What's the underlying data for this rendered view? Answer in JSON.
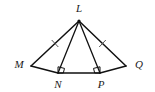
{
  "figure": {
    "background_color": "#ffffff",
    "stroke_color": "#111111",
    "label_color": "#1a1a1a",
    "tick_color": "#555555",
    "labels": {
      "apex": "L",
      "left": "M",
      "base_left": "N",
      "base_right": "P",
      "right": "Q"
    },
    "points": {
      "L": {
        "x": 79,
        "y": 21
      },
      "M": {
        "x": 31,
        "y": 66
      },
      "N": {
        "x": 58,
        "y": 73
      },
      "P": {
        "x": 100,
        "y": 73
      },
      "Q": {
        "x": 126,
        "y": 66
      }
    },
    "label_positions": {
      "L": {
        "x": 79,
        "y": 9
      },
      "M": {
        "x": 19,
        "y": 65
      },
      "N": {
        "x": 58,
        "y": 85
      },
      "P": {
        "x": 101,
        "y": 85
      },
      "Q": {
        "x": 139,
        "y": 65
      }
    },
    "segments": [
      {
        "name": "segment-LM",
        "from": "L",
        "to": "M"
      },
      {
        "name": "segment-LN",
        "from": "L",
        "to": "N"
      },
      {
        "name": "segment-LP",
        "from": "L",
        "to": "P"
      },
      {
        "name": "segment-LQ",
        "from": "L",
        "to": "Q"
      },
      {
        "name": "segment-MN",
        "from": "M",
        "to": "N"
      },
      {
        "name": "segment-NP",
        "from": "N",
        "to": "P"
      },
      {
        "name": "segment-PQ",
        "from": "P",
        "to": "Q"
      }
    ],
    "congruence_ticks": [
      {
        "name": "tick-mark-LM",
        "on_segment": "LM",
        "count": 1
      },
      {
        "name": "tick-mark-LQ",
        "on_segment": "LQ",
        "count": 1
      }
    ],
    "right_angles": [
      {
        "name": "right-angle-N",
        "at_point": "N",
        "between": "LN and NP"
      },
      {
        "name": "right-angle-P",
        "at_point": "P",
        "between": "LP and NP"
      }
    ]
  }
}
